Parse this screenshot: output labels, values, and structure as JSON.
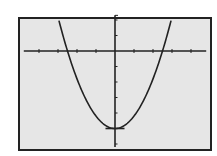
{
  "chart_data": {
    "type": "line",
    "title": "",
    "xlabel": "",
    "ylabel": "",
    "function": "y = 0.8x^2 - 5",
    "series": [
      {
        "name": "parabola",
        "x": [
          -2.9,
          -2.5,
          -2.0,
          -1.5,
          -1.0,
          -0.5,
          0.0,
          0.5,
          1.0,
          1.5,
          2.0,
          2.5,
          2.9
        ],
        "values": [
          1.73,
          0.0,
          -1.8,
          -3.2,
          -4.2,
          -4.8,
          -5.0,
          -4.8,
          -4.2,
          -3.2,
          -1.8,
          0.0,
          1.73
        ]
      }
    ],
    "xlim": [
      -4.8,
      4.8
    ],
    "ylim": [
      -6.2,
      2.3
    ],
    "x_ticks": [
      -4,
      -3,
      -2,
      -1,
      1,
      2,
      3,
      4
    ],
    "y_ticks": [
      -6,
      -5,
      -4,
      -3,
      -2,
      -1,
      1,
      2
    ],
    "grid": false,
    "legend": "none",
    "vertex": [
      0,
      -5
    ],
    "roots": [
      -2.5,
      2.5
    ]
  },
  "colors": {
    "screen_bg": "#e6e6e6",
    "ink": "#222222"
  }
}
